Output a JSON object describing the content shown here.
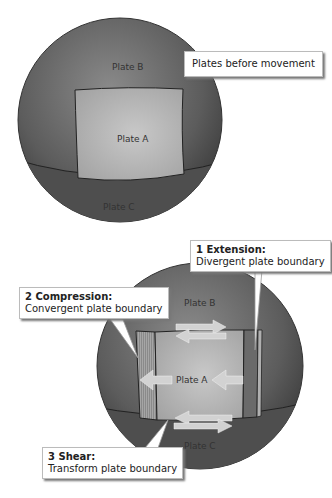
{
  "top_diagram": {
    "callout": "Plates before movement",
    "plate_a": "Plate A",
    "plate_b": "Plate B",
    "plate_c": "Plate C"
  },
  "bottom_diagram": {
    "plate_a": "Plate A",
    "plate_b": "Plate B",
    "plate_c": "Plate C",
    "callouts": [
      {
        "title": "1 Extension:",
        "text": "Divergent plate boundary"
      },
      {
        "title": "2 Compression:",
        "text": "Convergent plate  boundary"
      },
      {
        "title": "3 Shear:",
        "text": "Transform plate  boundary"
      }
    ]
  },
  "colors": {
    "sphere": "#5a5a5a",
    "plate_a": "#b5b5b5",
    "arrow": "#d0d0d0"
  }
}
